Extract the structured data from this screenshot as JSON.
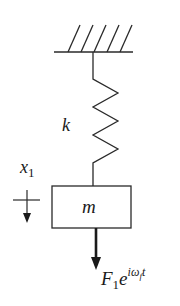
{
  "diagram": {
    "colors": {
      "stroke": "#2a2a2a",
      "background": "#ffffff"
    },
    "labels": {
      "spring": "k",
      "mass": "m",
      "displacement_main": "x",
      "displacement_sub": "1",
      "force_main": "F",
      "force_sub": "1",
      "force_base": "e",
      "force_exp_i": "i",
      "force_exp_omega": "ω",
      "force_exp_omega_sub": "f",
      "force_exp_t": "t"
    },
    "elements": [
      {
        "id": "ground",
        "type": "fixed-support",
        "hatch_count": 5
      },
      {
        "id": "spring",
        "type": "spring",
        "label": "k"
      },
      {
        "id": "mass",
        "type": "block",
        "label": "m"
      },
      {
        "id": "displacement",
        "type": "coordinate-arrow",
        "label": "x1",
        "direction": "down"
      },
      {
        "id": "force",
        "type": "force-arrow",
        "label": "F1 e^(i ω_f t)",
        "direction": "down"
      }
    ]
  }
}
